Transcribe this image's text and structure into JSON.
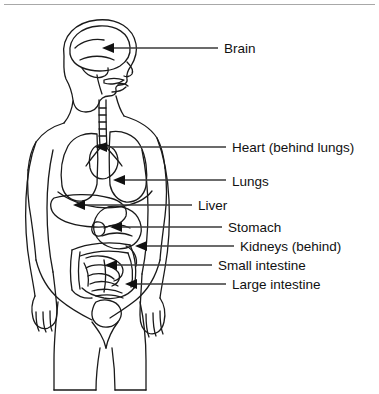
{
  "figure": {
    "style": {
      "background": "#ffffff",
      "outline_color": "#1a1a1a",
      "leader_color": "#3a3a3a",
      "text_color": "#111111",
      "rule_color": "#a8a8a8"
    }
  },
  "callouts": [
    {
      "id": "brain",
      "label": "Brain",
      "text_x": 224,
      "text_y": 41,
      "leader_x1": 218,
      "leader_x2": 108,
      "leader_y": 48,
      "arrow_x": 102,
      "arrow_y": 48
    },
    {
      "id": "heart",
      "label": "Heart (behind lungs)",
      "text_x": 232,
      "text_y": 140,
      "leader_x1": 226,
      "leader_x2": 101,
      "leader_y": 147,
      "arrow_x": 95,
      "arrow_y": 147
    },
    {
      "id": "lungs",
      "label": "Lungs",
      "text_x": 232,
      "text_y": 174,
      "leader_x1": 226,
      "leader_x2": 119,
      "leader_y": 180,
      "arrow_x": 113,
      "arrow_y": 180
    },
    {
      "id": "liver",
      "label": "Liver",
      "text_x": 198,
      "text_y": 198,
      "leader_x1": 192,
      "leader_x2": 79,
      "leader_y": 205,
      "arrow_x": 73,
      "arrow_y": 205
    },
    {
      "id": "stomach",
      "label": "Stomach",
      "text_x": 228,
      "text_y": 220,
      "leader_x1": 222,
      "leader_x2": 116,
      "leader_y": 227,
      "arrow_x": 110,
      "arrow_y": 227
    },
    {
      "id": "kidneys",
      "label": "Kidneys (behind)",
      "text_x": 240,
      "text_y": 239,
      "leader_x1": 234,
      "leader_x2": 141,
      "leader_y": 246,
      "arrow_x": 135,
      "arrow_y": 246
    },
    {
      "id": "small-intestine",
      "label": "Small intestine",
      "text_x": 218,
      "text_y": 258,
      "leader_x1": 212,
      "leader_x2": 111,
      "leader_y": 265,
      "arrow_x": 105,
      "arrow_y": 265
    },
    {
      "id": "large-intestine",
      "label": "Large intestine",
      "text_x": 232,
      "text_y": 277,
      "leader_x1": 226,
      "leader_x2": 131,
      "leader_y": 284,
      "arrow_x": 125,
      "arrow_y": 284
    }
  ]
}
